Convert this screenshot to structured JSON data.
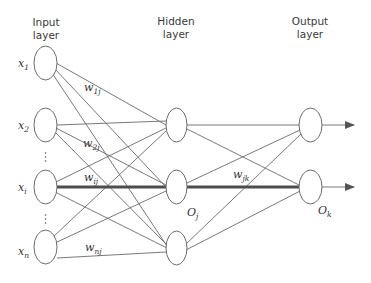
{
  "layers": {
    "input": {
      "title_line1": "Input",
      "title_line2": "layer"
    },
    "hidden": {
      "title_line1": "Hidden",
      "title_line2": "layer"
    },
    "output": {
      "title_line1": "Output",
      "title_line2": "layer"
    }
  },
  "input_nodes": [
    {
      "label": "x",
      "sub": "1"
    },
    {
      "label": "x",
      "sub": "2"
    },
    {
      "label": "x",
      "sub": "i"
    },
    {
      "label": "x",
      "sub": "n"
    }
  ],
  "weights": {
    "w1j": {
      "label": "w",
      "sub": "1j"
    },
    "w2j": {
      "label": "w",
      "sub": "2j"
    },
    "wij": {
      "label": "w",
      "sub": "ij"
    },
    "wnj": {
      "label": "w",
      "sub": "nj"
    },
    "wjk": {
      "label": "w",
      "sub": "jk"
    }
  },
  "outputs": {
    "hidden_out": {
      "label": "O",
      "sub": "j"
    },
    "final_out": {
      "label": "O",
      "sub": "k"
    }
  },
  "ellipsis": "⋮",
  "colors": {
    "line": "#6a6a6a",
    "bold_line": "#4d4d4d",
    "text": "#3a3a3a"
  }
}
